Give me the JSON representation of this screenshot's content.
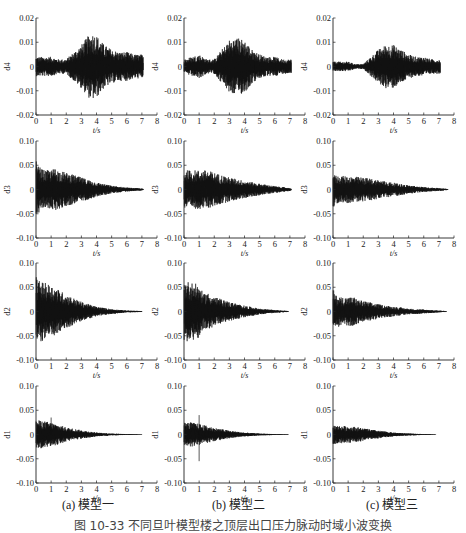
{
  "figure": {
    "caption": "图 10-33  不同旦叶模型楼之顶层出口压力脉动时域小波变换",
    "subcaptions": [
      "(a) 模型一",
      "(b) 模型二",
      "(c) 模型三"
    ],
    "ink_color": "#111111"
  },
  "chart_data": [
    {
      "type": "line",
      "row": "d4",
      "panels": [
        {
          "title": "(a) 模型一 d4",
          "xlabel": "t/s",
          "ylabel": "d4",
          "xlim": [
            0,
            8
          ],
          "ylim": [
            -0.02,
            0.02
          ],
          "xticks": [
            0,
            1,
            2,
            3,
            4,
            5,
            6,
            7,
            8
          ],
          "yticks": [
            "-0.02",
            "-0.01",
            "0",
            "0.01",
            "0.02"
          ],
          "envelope": {
            "t": [
              0,
              0.5,
              1,
              1.5,
              2,
              2.5,
              3,
              3.5,
              3.7,
              4,
              4.5,
              5,
              5.5,
              6,
              6.5,
              7,
              7.1
            ],
            "amp": [
              0.004,
              0.004,
              0.004,
              0.003,
              0.003,
              0.006,
              0.009,
              0.013,
              0.014,
              0.013,
              0.009,
              0.007,
              0.006,
              0.006,
              0.005,
              0.005,
              0.004
            ]
          },
          "duration_s": 7.1
        },
        {
          "title": "(b) 模型二 d4",
          "xlabel": "t/s",
          "ylabel": "d4",
          "xlim": [
            0,
            8
          ],
          "ylim": [
            -0.02,
            0.02
          ],
          "xticks": [
            0,
            1,
            2,
            3,
            4,
            5,
            6,
            7,
            8
          ],
          "yticks": [
            "-0.02",
            "-0.01",
            "0",
            "0.01",
            "0.02"
          ],
          "envelope": {
            "t": [
              0,
              0.5,
              1,
              1.5,
              2,
              2.5,
              3,
              3.5,
              4,
              4.5,
              5,
              5.5,
              6,
              6.5,
              7,
              7.1
            ],
            "amp": [
              0.003,
              0.004,
              0.005,
              0.003,
              0.003,
              0.007,
              0.011,
              0.012,
              0.011,
              0.007,
              0.005,
              0.004,
              0.004,
              0.003,
              0.003,
              0.003
            ]
          },
          "duration_s": 7.1
        },
        {
          "title": "(c) 模型三 d4",
          "xlabel": "t/s",
          "ylabel": "d4",
          "xlim": [
            0,
            8
          ],
          "ylim": [
            -0.02,
            0.02
          ],
          "xticks": [
            0,
            1,
            2,
            3,
            4,
            5,
            6,
            7,
            8
          ],
          "yticks": [
            "-0.02",
            "-0.01",
            "0",
            "0.01",
            "0.02"
          ],
          "envelope": {
            "t": [
              0,
              0.5,
              1,
              1.5,
              2,
              2.5,
              3,
              3.5,
              4,
              4.5,
              5,
              5.5,
              6,
              6.5,
              7,
              7.1
            ],
            "amp": [
              0.002,
              0.002,
              0.002,
              0.001,
              0.001,
              0.004,
              0.007,
              0.009,
              0.009,
              0.007,
              0.005,
              0.004,
              0.004,
              0.003,
              0.003,
              0.003
            ]
          },
          "duration_s": 7.1
        }
      ]
    },
    {
      "type": "line",
      "row": "d3",
      "panels": [
        {
          "title": "(a) 模型一 d3",
          "xlabel": "t/s",
          "ylabel": "d3",
          "xlim": [
            0,
            8
          ],
          "ylim": [
            -0.1,
            0.1
          ],
          "xticks": [
            0,
            1,
            2,
            3,
            4,
            5,
            6,
            7,
            8
          ],
          "yticks": [
            "-0.10",
            "-0.05",
            "0",
            "0.05",
            "0.10"
          ],
          "envelope": {
            "t": [
              0,
              0.1,
              0.5,
              1,
              1.3,
              1.5,
              2,
              3,
              4,
              5,
              6,
              7,
              7.1
            ],
            "amp": [
              0.06,
              0.05,
              0.04,
              0.04,
              0.045,
              0.04,
              0.035,
              0.025,
              0.015,
              0.008,
              0.004,
              0.002,
              0.001
            ]
          },
          "duration_s": 7.1
        },
        {
          "title": "(b) 模型二 d3",
          "xlabel": "t/s",
          "ylabel": "d3",
          "xlim": [
            0,
            8
          ],
          "ylim": [
            -0.1,
            0.1
          ],
          "xticks": [
            0,
            1,
            2,
            3,
            4,
            5,
            6,
            7,
            8
          ],
          "yticks": [
            "-0.10",
            "-0.05",
            "0",
            "0.05",
            "0.10"
          ],
          "envelope": {
            "t": [
              0,
              0.5,
              1,
              1.5,
              2,
              3,
              4,
              5,
              6,
              7,
              7.1
            ],
            "amp": [
              0.04,
              0.04,
              0.04,
              0.04,
              0.035,
              0.025,
              0.018,
              0.012,
              0.007,
              0.003,
              0.002
            ]
          },
          "duration_s": 7.1
        },
        {
          "title": "(c) 模型三 d3",
          "xlabel": "t/s",
          "ylabel": "d3",
          "xlim": [
            0,
            8
          ],
          "ylim": [
            -0.1,
            0.1
          ],
          "xticks": [
            0,
            1,
            2,
            3,
            4,
            5,
            6,
            7,
            8
          ],
          "yticks": [
            "-0.10",
            "-0.05",
            "0",
            "0.05",
            "0.10"
          ],
          "envelope": {
            "t": [
              0,
              0.1,
              0.5,
              1,
              2,
              3,
              4,
              5,
              6,
              7,
              7.6
            ],
            "amp": [
              0.045,
              0.03,
              0.028,
              0.028,
              0.025,
              0.02,
              0.014,
              0.009,
              0.005,
              0.003,
              0.001
            ]
          },
          "duration_s": 7.6
        }
      ]
    },
    {
      "type": "line",
      "row": "d2",
      "panels": [
        {
          "title": "(a) 模型一 d2",
          "xlabel": "t/s",
          "ylabel": "d2",
          "xlim": [
            0,
            8
          ],
          "ylim": [
            -0.1,
            0.1
          ],
          "xticks": [
            0,
            1,
            2,
            3,
            4,
            5,
            6,
            7,
            8
          ],
          "yticks": [
            "-0.10",
            "-0.05",
            "0",
            "0.05",
            "0.10"
          ],
          "envelope": {
            "t": [
              0,
              0.1,
              0.5,
              1,
              1.5,
              2,
              3,
              4,
              5,
              6,
              7
            ],
            "amp": [
              0.075,
              0.065,
              0.06,
              0.055,
              0.045,
              0.035,
              0.02,
              0.01,
              0.005,
              0.002,
              0.001
            ]
          },
          "duration_s": 7.0
        },
        {
          "title": "(b) 模型二 d2",
          "xlabel": "t/s",
          "ylabel": "d2",
          "xlim": [
            0,
            8
          ],
          "ylim": [
            -0.1,
            0.1
          ],
          "xticks": [
            0,
            1,
            2,
            3,
            4,
            5,
            6,
            7,
            8
          ],
          "yticks": [
            "-0.10",
            "-0.05",
            "0",
            "0.05",
            "0.10"
          ],
          "envelope": {
            "t": [
              0,
              0.5,
              1,
              1.3,
              1.5,
              2,
              3,
              4,
              5,
              6,
              6.9
            ],
            "amp": [
              0.065,
              0.06,
              0.055,
              0.035,
              0.04,
              0.03,
              0.02,
              0.012,
              0.006,
              0.003,
              0.001
            ]
          },
          "duration_s": 6.9
        },
        {
          "title": "(c) 模型三 d2",
          "xlabel": "t/s",
          "ylabel": "d2",
          "xlim": [
            0,
            8
          ],
          "ylim": [
            -0.1,
            0.1
          ],
          "xticks": [
            0,
            1,
            2,
            3,
            4,
            5,
            6,
            7,
            8
          ],
          "yticks": [
            "-0.10",
            "-0.05",
            "0",
            "0.05",
            "0.10"
          ],
          "envelope": {
            "t": [
              0,
              0.1,
              0.5,
              1,
              1.4,
              1.6,
              2,
              3,
              4,
              5,
              6,
              7,
              7.5
            ],
            "amp": [
              0.05,
              0.035,
              0.03,
              0.03,
              0.03,
              0.025,
              0.022,
              0.015,
              0.01,
              0.006,
              0.004,
              0.002,
              0.001
            ]
          },
          "duration_s": 7.5
        }
      ]
    },
    {
      "type": "line",
      "row": "d1",
      "panels": [
        {
          "title": "(a) 模型一 d1",
          "xlabel": "t/s",
          "ylabel": "d1",
          "xlim": [
            0,
            8
          ],
          "ylim": [
            -0.1,
            0.1
          ],
          "xticks": [
            0,
            1,
            2,
            3,
            4,
            5,
            6,
            7,
            8
          ],
          "yticks": [
            "-0.10",
            "-0.05",
            "0",
            "0.05",
            "0.10"
          ],
          "envelope": {
            "t": [
              0,
              0.5,
              1,
              1.5,
              2,
              3,
              4,
              5,
              6,
              7
            ],
            "amp": [
              0.03,
              0.028,
              0.025,
              0.02,
              0.015,
              0.009,
              0.004,
              0.002,
              0.001,
              0.0005
            ]
          },
          "spikes": [
            {
              "t": 1.0,
              "value": 0.035
            }
          ],
          "duration_s": 7.0
        },
        {
          "title": "(b) 模型二 d1",
          "xlabel": "t/s",
          "ylabel": "d1",
          "xlim": [
            0,
            8
          ],
          "ylim": [
            -0.1,
            0.1
          ],
          "xticks": [
            0,
            1,
            2,
            3,
            4,
            5,
            6,
            7,
            8
          ],
          "yticks": [
            "-0.10",
            "-0.05",
            "0",
            "0.05",
            "0.10"
          ],
          "envelope": {
            "t": [
              0,
              0.5,
              1,
              1.5,
              2,
              3,
              4,
              5,
              6,
              6.9
            ],
            "amp": [
              0.025,
              0.025,
              0.022,
              0.018,
              0.014,
              0.008,
              0.004,
              0.002,
              0.001,
              0.0005
            ]
          },
          "spikes": [
            {
              "t": 1.0,
              "value": 0.04
            },
            {
              "t": 1.0,
              "value": -0.055
            }
          ],
          "duration_s": 6.9
        },
        {
          "title": "(c) 模型三 d1",
          "xlabel": "t/s",
          "ylabel": "d1",
          "xlim": [
            0,
            8
          ],
          "ylim": [
            -0.1,
            0.1
          ],
          "xticks": [
            0,
            1,
            2,
            3,
            4,
            5,
            6,
            7,
            8
          ],
          "yticks": [
            "-0.10",
            "-0.05",
            "0",
            "0.05",
            "0.10"
          ],
          "envelope": {
            "t": [
              0,
              0.5,
              1,
              1.5,
              2,
              3,
              4,
              5,
              6,
              6.8
            ],
            "amp": [
              0.02,
              0.018,
              0.017,
              0.016,
              0.013,
              0.008,
              0.004,
              0.002,
              0.001,
              0.0005
            ]
          },
          "duration_s": 6.8
        }
      ]
    }
  ],
  "layout": {
    "cols_x0": [
      36,
      184,
      333
    ],
    "col_width": 121,
    "rows_ytop": [
      18,
      141,
      263,
      386
    ],
    "row_height": 97
  }
}
